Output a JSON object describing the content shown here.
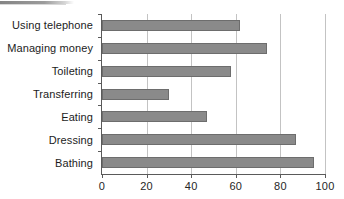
{
  "chart_data": {
    "type": "bar",
    "orientation": "horizontal",
    "title": "",
    "xlabel": "",
    "ylabel": "",
    "categories": [
      "Bathing",
      "Dressing",
      "Eating",
      "Transferring",
      "Toileting",
      "Managing money",
      "Using telephone"
    ],
    "values": [
      95,
      87,
      47,
      30,
      58,
      74,
      62
    ],
    "xlim": [
      0,
      100
    ],
    "xticks": [
      0,
      20,
      40,
      60,
      80,
      100
    ],
    "xtick_labels": [
      "0",
      "20",
      "40",
      "60",
      "80",
      "100"
    ],
    "grid": "vertical",
    "legend": null,
    "bar_color": "#8a8a8a",
    "bar_border_color": "#6d6d6d",
    "gridline_color": "#c3c3c3",
    "axis_color": "#5a5a5a",
    "text_color": "#1c1c1c",
    "background": "#ffffff"
  },
  "artifact": {
    "name": "scan-streak",
    "color": "#6e6e6e"
  }
}
